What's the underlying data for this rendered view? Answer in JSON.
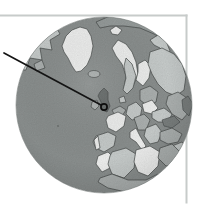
{
  "palette": {
    "background": "#ffffff",
    "frame": "#c7cbca",
    "ocean": "#8f9493",
    "ocean_deep": "#7e8382",
    "rim": "#787d7c",
    "outline": "#474c4b",
    "land_white": "#f7f8f7",
    "land_light": "#cdd2d1",
    "land_medium": "#b2b7b6",
    "land_dark": "#9aa09f",
    "land_darker": "#6a6f6e",
    "arrow": "#141414",
    "marker": "#0e0e0e"
  },
  "globe": {
    "cx": 104,
    "cy": 105,
    "r": 88
  },
  "frame": {
    "top": {
      "x": 0,
      "y": 14.5,
      "w": 187.5,
      "h": 2
    },
    "right": {
      "x": 185.5,
      "y": 14.5,
      "w": 2,
      "h": 189
    }
  },
  "arrow": {
    "x1": 4,
    "y1": 53,
    "x2": 101,
    "y2": 105
  },
  "marker": {
    "cx": 104,
    "cy": 107,
    "r": 3.1
  }
}
